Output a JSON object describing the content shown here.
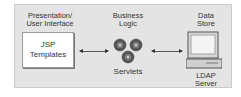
{
  "diagram": {
    "tiers": [
      {
        "heading_line1": "Presentation/",
        "heading_line2": "User Interface",
        "component_line1": "JSP",
        "component_line2": "Templates",
        "icon": "document-box"
      },
      {
        "heading_line1": "Business",
        "heading_line2": "Logic",
        "component_label": "Servlets",
        "icon": "gears-icon"
      },
      {
        "heading_line1": "Data",
        "heading_line2": "Store",
        "component_line1": "LDAP",
        "component_line2": "Server",
        "icon": "computer-icon"
      }
    ],
    "connections": [
      {
        "from": "JSP Templates",
        "to": "Servlets",
        "type": "bidirectional"
      },
      {
        "from": "Servlets",
        "to": "LDAP Server",
        "type": "bidirectional"
      }
    ],
    "colors": {
      "background": "#e4e4e4",
      "border": "#c9c9c9",
      "text": "#333333"
    }
  }
}
